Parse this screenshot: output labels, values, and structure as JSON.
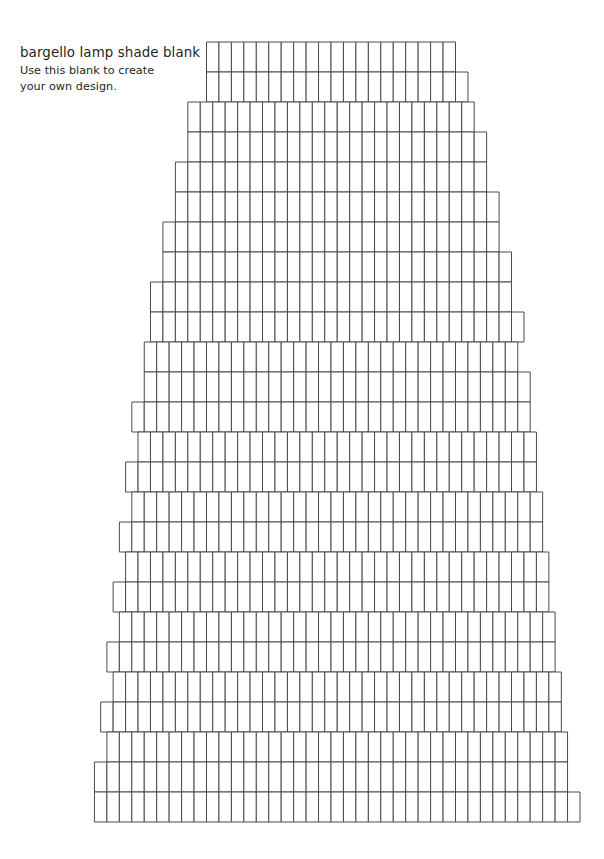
{
  "page": {
    "background_color": "#ffffff",
    "width": 604,
    "height": 859
  },
  "caption": {
    "title": "bargello lamp shade blank",
    "subtitle_line1": "Use this blank to create",
    "subtitle_line2": "your own design.",
    "text_color": "#231f20"
  },
  "diagram": {
    "name": "bargello-lamp-shade-blank-grid",
    "stroke_color": "#4a4a4c",
    "fill_color": "#ffffff",
    "stroke_width": 1,
    "cell_width": 12.45,
    "row_height": 30,
    "center_x": 331,
    "top_y": 42,
    "bottom_y": 822,
    "row_count": 26,
    "rows": [
      {
        "index": 1,
        "cells": 20,
        "offset": 0.0,
        "y": 42
      },
      {
        "index": 2,
        "cells": 21,
        "offset": 0.5,
        "y": 72
      },
      {
        "index": 3,
        "cells": 23,
        "offset": 0.0,
        "y": 102
      },
      {
        "index": 4,
        "cells": 24,
        "offset": 0.5,
        "y": 132
      },
      {
        "index": 5,
        "cells": 25,
        "offset": 0.0,
        "y": 162
      },
      {
        "index": 6,
        "cells": 26,
        "offset": 0.5,
        "y": 192
      },
      {
        "index": 7,
        "cells": 27,
        "offset": 0.0,
        "y": 222
      },
      {
        "index": 8,
        "cells": 28,
        "offset": 0.5,
        "y": 252
      },
      {
        "index": 9,
        "cells": 29,
        "offset": 0.0,
        "y": 282
      },
      {
        "index": 10,
        "cells": 30,
        "offset": 0.5,
        "y": 312
      },
      {
        "index": 11,
        "cells": 30,
        "offset": 0.0,
        "y": 342
      },
      {
        "index": 12,
        "cells": 31,
        "offset": 0.5,
        "y": 372
      },
      {
        "index": 13,
        "cells": 32,
        "offset": 0.0,
        "y": 402
      },
      {
        "index": 14,
        "cells": 32,
        "offset": 0.5,
        "y": 432
      },
      {
        "index": 15,
        "cells": 33,
        "offset": 0.0,
        "y": 462
      },
      {
        "index": 16,
        "cells": 33,
        "offset": 0.5,
        "y": 492
      },
      {
        "index": 17,
        "cells": 34,
        "offset": 0.0,
        "y": 522
      },
      {
        "index": 18,
        "cells": 34,
        "offset": 0.5,
        "y": 552
      },
      {
        "index": 19,
        "cells": 35,
        "offset": 0.0,
        "y": 582
      },
      {
        "index": 20,
        "cells": 35,
        "offset": 0.5,
        "y": 612
      },
      {
        "index": 21,
        "cells": 36,
        "offset": 0.0,
        "y": 642
      },
      {
        "index": 22,
        "cells": 36,
        "offset": 0.5,
        "y": 672
      },
      {
        "index": 23,
        "cells": 37,
        "offset": 0.0,
        "y": 702
      },
      {
        "index": 24,
        "cells": 37,
        "offset": 0.5,
        "y": 732
      },
      {
        "index": 25,
        "cells": 38,
        "offset": 0.0,
        "y": 762
      },
      {
        "index": 26,
        "cells": 39,
        "offset": 0.5,
        "y": 792
      }
    ]
  }
}
